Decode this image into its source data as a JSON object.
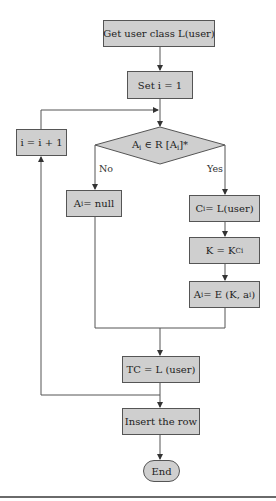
{
  "diagram": {
    "type": "flowchart",
    "nodes": {
      "get_class": {
        "label": "Get user class L(user)"
      },
      "set_i": {
        "label": "Set i = 1"
      },
      "increment": {
        "label": "i = i + 1"
      },
      "decision": {
        "pre": "A",
        "pre_sub": "i",
        "mid": " ∈ R [A",
        "mid_sub": "i",
        "post": "]*"
      },
      "null": {
        "pre": "A",
        "sub": "i",
        "post": " = null"
      },
      "ci": {
        "pre": "C",
        "sub": "i",
        "post": " = L(user)"
      },
      "k": {
        "pre": "K = K",
        "sub": "Ci",
        "post": ""
      },
      "encrypt": {
        "pre": "A",
        "sub": "i",
        "post": " = E (K, a",
        "sub2": "i",
        "post2": ")"
      },
      "tc": {
        "label": "TC = L (user)"
      },
      "insert": {
        "label": "Insert the row"
      },
      "end": {
        "label": "End"
      }
    },
    "branches": {
      "no": "No",
      "yes": "Yes"
    },
    "colors": {
      "node_fill": "#cfcfcf",
      "stroke": "#555555"
    }
  }
}
